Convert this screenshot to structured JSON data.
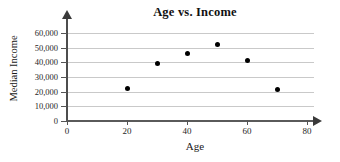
{
  "chart_data": {
    "type": "scatter",
    "title": "Age vs. Income",
    "xlabel": "Age",
    "ylabel": "Median Income",
    "xlim": [
      0,
      80
    ],
    "ylim": [
      0,
      65000
    ],
    "grid": true,
    "legend": "none",
    "x_ticks": [
      "0",
      "20",
      "40",
      "60",
      "80"
    ],
    "x_tick_values": [
      0,
      20,
      40,
      60,
      80
    ],
    "y_ticks": [
      "0",
      "10,000",
      "20,000",
      "30,000",
      "40,000",
      "50,000",
      "60,000"
    ],
    "y_tick_values": [
      0,
      10000,
      20000,
      30000,
      40000,
      50000,
      60000
    ],
    "series": [
      {
        "name": "Median Income by Age",
        "points": [
          {
            "x": 20,
            "y": 22500
          },
          {
            "x": 30,
            "y": 39500
          },
          {
            "x": 40,
            "y": 46000
          },
          {
            "x": 50,
            "y": 52000
          },
          {
            "x": 60,
            "y": 41500
          },
          {
            "x": 70,
            "y": 21500
          }
        ]
      }
    ],
    "marker_color": "#000000",
    "gridline_color": "#c9c9c9",
    "axis_color": "#4d4d4d"
  }
}
